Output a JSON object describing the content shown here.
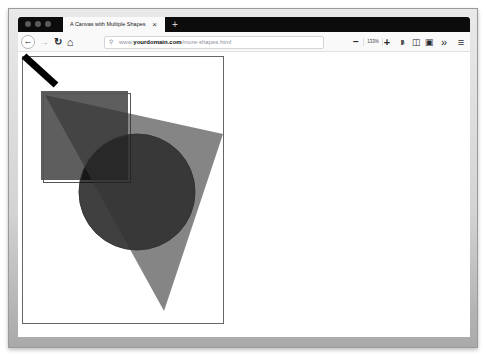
{
  "browser": {
    "tab": {
      "title": "A Canvas with Multiple Shapes",
      "close_glyph": "×"
    },
    "new_tab_glyph": "+",
    "toolbar": {
      "back_glyph": "←",
      "forward_glyph": "→",
      "reload_glyph": "↻",
      "home_glyph": "⌂",
      "url": {
        "search_glyph": "⚲",
        "prefix": "www.",
        "domain": "yourdomain.com",
        "path": "/more-shapes.html"
      },
      "zoom_out_glyph": "−",
      "zoom_level": "133%",
      "zoom_in_glyph": "+",
      "library_glyph": "|||\\",
      "sidebar_glyph": "◫",
      "reader_glyph": "▣",
      "overflow_glyph": "»",
      "menu_glyph": "≡"
    }
  },
  "canvas": {
    "border_color": "#666666",
    "shapes": [
      {
        "type": "rect",
        "name": "square",
        "x": 23,
        "y": 39,
        "w": 87,
        "h": 89,
        "fill": "#1a1a1a",
        "opacity": 0.7
      },
      {
        "type": "rect-outline",
        "name": "square-outline",
        "x": 25,
        "y": 41,
        "w": 87,
        "h": 89,
        "stroke": "#555555"
      },
      {
        "type": "circle",
        "name": "circle",
        "cx": 119,
        "cy": 140,
        "r": 58,
        "fill": "#000000",
        "opacity": 0.75,
        "stroke": "#333333"
      },
      {
        "type": "triangle",
        "name": "triangle",
        "points": [
          [
            27,
            43
          ],
          [
            205,
            82
          ],
          [
            146,
            259
          ]
        ],
        "fill": "#333333",
        "opacity": 0.6
      },
      {
        "type": "line",
        "name": "thick-line",
        "x1": 6,
        "y1": 4,
        "x2": 38,
        "y2": 33,
        "stroke": "#000000",
        "width": 7
      }
    ]
  }
}
